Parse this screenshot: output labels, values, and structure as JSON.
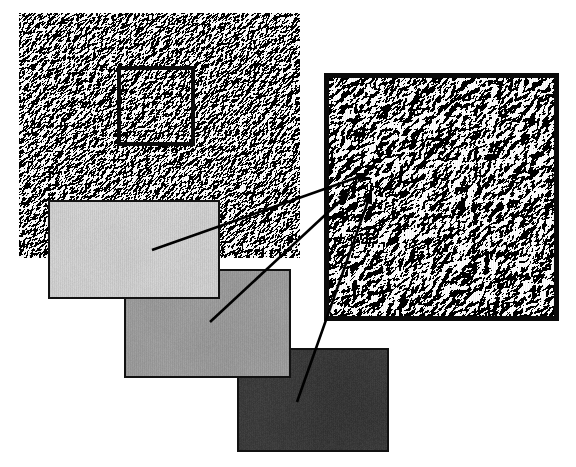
{
  "figure": {
    "type": "image-figure",
    "width": 576,
    "height": 467,
    "background_color": "#ffffff",
    "caption": ""
  },
  "overview": {
    "name": "overview-texture",
    "label": "Surface texture overview",
    "x": 19,
    "y": 13,
    "width": 281,
    "height": 245,
    "mean_gray": "#9b9b9b",
    "relief": "embossed",
    "border_color": "none"
  },
  "roi_box": {
    "name": "region-of-interest",
    "label": "Region of interest",
    "x": 117,
    "y": 66,
    "width": 78,
    "height": 80,
    "stroke_color": "#0b0b0b",
    "stroke_width": 4
  },
  "detail": {
    "name": "detail-texture",
    "label": "Magnified detail view",
    "x": 324,
    "y": 73,
    "width": 235,
    "height": 248,
    "mean_gray": "#a0a0a0",
    "relief": "embossed",
    "border_color": "#0a0a0a",
    "border_width": 5,
    "magnification": "3x"
  },
  "patches": [
    {
      "name": "patch-light",
      "label": "Light gray sample",
      "x": 48,
      "y": 200,
      "width": 172,
      "height": 99,
      "fill_color": "#d0d0d0",
      "border_color": "#111111",
      "border_width": 2,
      "tone": "light"
    },
    {
      "name": "patch-mid",
      "label": "Mid gray sample",
      "x": 124,
      "y": 269,
      "width": 167,
      "height": 109,
      "fill_color": "#9d9d9d",
      "border_color": "#111111",
      "border_width": 2,
      "tone": "mid"
    },
    {
      "name": "patch-dark",
      "label": "Dark gray sample",
      "x": 237,
      "y": 348,
      "width": 152,
      "height": 104,
      "fill_color": "#3b3b3b",
      "border_color": "#111111",
      "border_width": 2,
      "tone": "dark"
    }
  ],
  "arrows": [
    {
      "name": "arrow-light-to-detail",
      "from_patch": "patch-light",
      "tail_x": 152,
      "tail_y": 250,
      "head_x": 370,
      "head_y": 173,
      "stroke_color": "#000000",
      "stroke_width": 2.6
    },
    {
      "name": "arrow-mid-to-detail",
      "from_patch": "patch-mid",
      "tail_x": 210,
      "tail_y": 322,
      "head_x": 351,
      "head_y": 191,
      "stroke_color": "#000000",
      "stroke_width": 2.6
    },
    {
      "name": "arrow-dark-to-detail",
      "from_patch": "patch-dark",
      "tail_x": 297,
      "tail_y": 402,
      "head_x": 372,
      "head_y": 190,
      "stroke_color": "#000000",
      "stroke_width": 2.6
    }
  ],
  "colors": {
    "ink": "#000000",
    "paper": "#ffffff",
    "texture_base": "#9b9b9b",
    "highlight": "#e8e8e8",
    "shadow": "#3a3a3a"
  }
}
